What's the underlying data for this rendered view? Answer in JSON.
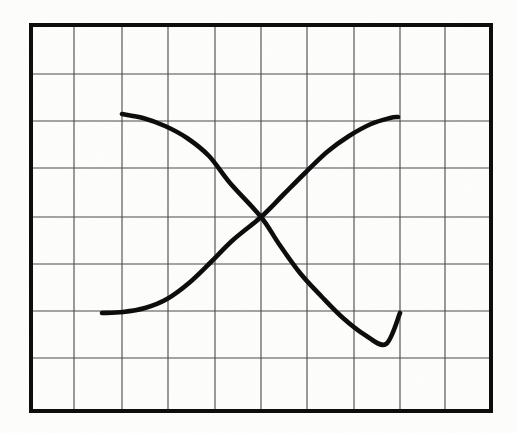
{
  "figure": {
    "kind": "line-chart-figure",
    "title": "",
    "caption": "",
    "background_color": "#fdfdfc",
    "render_style": "scanned-print"
  },
  "plot_frame": {
    "border_color": "#111111",
    "border_width_px": 4,
    "left_px": 31,
    "top_px": 25,
    "right_px": 491,
    "bottom_px": 411
  },
  "grid": {
    "line_color": "#4a4a4a",
    "line_width_px": 1.1,
    "show": true,
    "columns": 10,
    "rows": 8,
    "vertical_x_px": [
      31,
      74,
      122,
      168,
      215,
      261,
      307,
      354,
      400,
      445,
      491
    ],
    "horizontal_y_px": [
      25,
      74,
      121,
      168,
      217,
      264,
      311,
      358,
      411
    ]
  },
  "chart_data": {
    "type": "line",
    "title": "",
    "subtitle": "",
    "xlabel": "",
    "ylabel": "",
    "xlim": [
      0,
      10
    ],
    "ylim": [
      0,
      8
    ],
    "grid": true,
    "legend_position": "none",
    "tick_labels": {
      "x": [],
      "y": []
    },
    "annotations": [],
    "intersection": {
      "label": "curves-crossing-point",
      "x": 5.0,
      "y": 4.0,
      "px": [
        261,
        217
      ]
    },
    "series": [
      {
        "name": "descending-curve",
        "color": "#111111",
        "width_px": 4.6,
        "shape": "sigmoid-decreasing",
        "x": [
          2.12,
          2.6,
          3.1,
          3.6,
          4.1,
          4.6,
          5.0,
          5.4,
          5.9,
          6.4,
          6.9,
          7.4,
          7.9,
          8.35
        ],
        "y": [
          6.09,
          6.0,
          5.82,
          5.55,
          5.18,
          4.6,
          4.0,
          3.45,
          2.85,
          2.3,
          1.85,
          1.5,
          1.3,
          1.21
        ],
        "px": [
          [
            122,
            114
          ],
          [
            143,
            118
          ],
          [
            165,
            126
          ],
          [
            187,
            138
          ],
          [
            209,
            156
          ],
          [
            230,
            183
          ],
          [
            261,
            217
          ],
          [
            279,
            244
          ],
          [
            300,
            273
          ],
          [
            322,
            297
          ],
          [
            343,
            318
          ],
          [
            365,
            335
          ],
          [
            386,
            344
          ],
          [
            400,
            313
          ]
        ]
      },
      {
        "name": "ascending-curve",
        "color": "#111111",
        "width_px": 4.6,
        "shape": "sigmoid-increasing",
        "x": [
          1.65,
          2.1,
          2.6,
          3.1,
          3.6,
          4.1,
          4.6,
          5.0,
          5.4,
          5.9,
          6.4,
          6.9,
          7.4,
          7.9,
          8.3
        ],
        "y": [
          1.2,
          1.21,
          1.3,
          1.5,
          1.85,
          2.3,
          3.3,
          4.0,
          4.65,
          5.2,
          5.65,
          5.95,
          6.08,
          6.1,
          6.06
        ],
        "px": [
          [
            102,
            313
          ],
          [
            123,
            312
          ],
          [
            145,
            308
          ],
          [
            167,
            299
          ],
          [
            189,
            283
          ],
          [
            211,
            262
          ],
          [
            233,
            240
          ],
          [
            261,
            217
          ],
          [
            283,
            195
          ],
          [
            305,
            173
          ],
          [
            327,
            152
          ],
          [
            349,
            136
          ],
          [
            371,
            124
          ],
          [
            390,
            118
          ],
          [
            398,
            117
          ]
        ]
      }
    ]
  }
}
